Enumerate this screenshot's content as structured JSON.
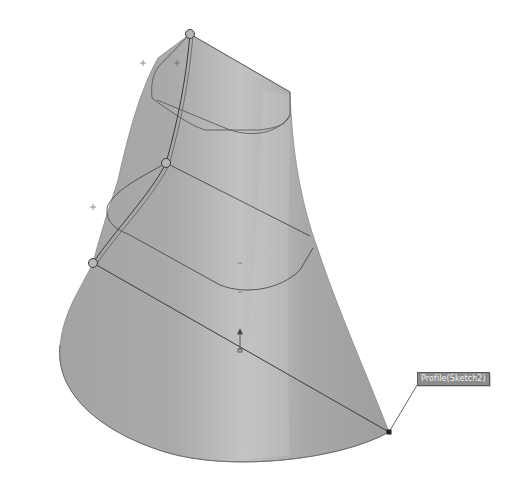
{
  "scene": {
    "type": "cad-loft-preview",
    "background": "#ffffff",
    "surface_color": "#a9a9a9",
    "surface_highlight": "#c4c4c4",
    "surface_shadow": "#8f8f8f",
    "edge_color": "#4a4a4a",
    "guide_curve_color": "#3a3a3a"
  },
  "callout": {
    "label": "Profile(Sketch2)",
    "anchor_point": [
      389,
      432
    ],
    "box_position": [
      417,
      372
    ]
  },
  "control_points": [
    {
      "name": "guide-point-top",
      "x": 190,
      "y": 34
    },
    {
      "name": "guide-point-middle",
      "x": 166,
      "y": 163
    },
    {
      "name": "guide-point-bottom",
      "x": 93,
      "y": 263
    }
  ],
  "markers": [
    {
      "name": "plus-marker-top-outside",
      "x": 143,
      "y": 63
    },
    {
      "name": "plus-marker-top-inside",
      "x": 177,
      "y": 63
    },
    {
      "name": "plus-marker-left",
      "x": 93,
      "y": 207
    }
  ]
}
